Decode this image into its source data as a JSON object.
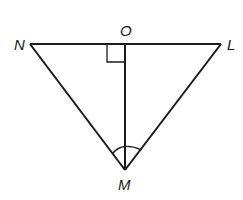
{
  "diagram": {
    "type": "geometry-triangle",
    "labels": {
      "N": "N",
      "O": "O",
      "L": "L",
      "M": "M"
    },
    "points": {
      "N": [
        30,
        44
      ],
      "O": [
        125,
        44
      ],
      "L": [
        221,
        44
      ],
      "M": [
        125,
        170
      ]
    },
    "segments": [
      "NL",
      "NM",
      "LM",
      "OM"
    ],
    "marks": {
      "right_angle_at": "O",
      "congruent_angles_at": "M"
    },
    "stroke_color": "#1a1a1a"
  }
}
